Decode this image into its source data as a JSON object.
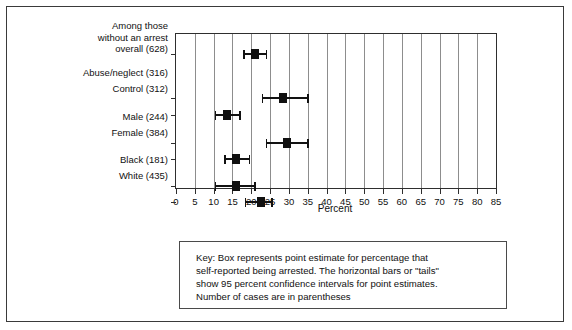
{
  "figure": {
    "xaxis_title": "Percent"
  },
  "chart_data": {
    "type": "bar",
    "title": "",
    "xlabel": "Percent",
    "ylabel": "",
    "xlim": [
      0,
      85
    ],
    "xticks": [
      0,
      5,
      10,
      15,
      20,
      25,
      30,
      35,
      40,
      45,
      50,
      55,
      60,
      65,
      70,
      75,
      80,
      85
    ],
    "xtick_labels": [
      "0",
      "5",
      "10",
      "15",
      "20",
      "25",
      "30",
      "35",
      "40",
      "45",
      "50",
      "55",
      "60",
      "65",
      "70",
      "75",
      "80",
      "85"
    ],
    "grid": true,
    "grid_axis": "x",
    "legend_position": "below-plot",
    "orientation": "horizontal",
    "categories": [
      "Among those without an arrest overall (628)",
      "Abuse/neglect (316)",
      "Control (312)",
      "Male (244)",
      "Female (384)",
      "Black (181)",
      "White (435)"
    ],
    "values": [
      21.0,
      28.5,
      13.5,
      29.5,
      16.0,
      16.0,
      22.5
    ],
    "ci_low": [
      18.0,
      23.0,
      10.5,
      24.0,
      13.0,
      10.5,
      18.5
    ],
    "ci_high": [
      24.0,
      35.0,
      17.0,
      35.0,
      19.5,
      21.0,
      25.5
    ],
    "points": [
      {
        "label": "Among those without an arrest overall (628)",
        "n": 628,
        "value": 21.0,
        "ci_low": 18.0,
        "ci_high": 24.0
      },
      {
        "label": "Abuse/neglect (316)",
        "n": 316,
        "value": 28.5,
        "ci_low": 23.0,
        "ci_high": 35.0
      },
      {
        "label": "Control (312)",
        "n": 312,
        "value": 13.5,
        "ci_low": 10.5,
        "ci_high": 17.0
      },
      {
        "label": "Male (244)",
        "n": 244,
        "value": 29.5,
        "ci_low": 24.0,
        "ci_high": 35.0
      },
      {
        "label": "Female (384)",
        "n": 384,
        "value": 16.0,
        "ci_low": 13.0,
        "ci_high": 19.5
      },
      {
        "label": "Black (181)",
        "n": 181,
        "value": 16.0,
        "ci_low": 10.5,
        "ci_high": 21.0
      },
      {
        "label": "White (435)",
        "n": 435,
        "value": 22.5,
        "ci_low": 18.5,
        "ci_high": 25.5
      }
    ]
  },
  "category_labels": [
    {
      "lines": [
        "Among those",
        "without an arrest",
        "overall (628)"
      ],
      "top": 5
    },
    {
      "lines": [
        "Abuse/neglect (316)"
      ],
      "top": 52
    },
    {
      "lines": [
        "Control (312)"
      ],
      "top": 68
    },
    {
      "lines": [
        "Male (244)"
      ],
      "top": 96
    },
    {
      "lines": [
        "Female (384)"
      ],
      "top": 112
    },
    {
      "lines": [
        "Black (181)"
      ],
      "top": 139
    },
    {
      "lines": [
        "White (435)"
      ],
      "top": 155
    }
  ],
  "key": {
    "lines": [
      "Key: Box represents point estimate for percentage that",
      "self-reported being arrested. The horizontal bars or \"tails\"",
      "show 95 percent confidence intervals for point estimates.",
      "Number of cases are in parentheses"
    ]
  }
}
